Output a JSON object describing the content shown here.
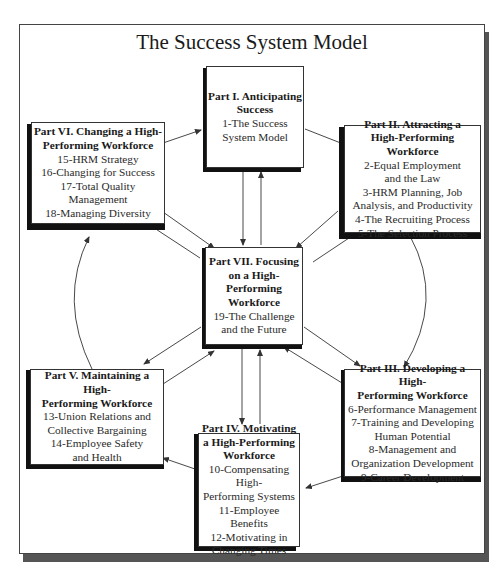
{
  "title": "The Success System Model",
  "nodes": {
    "p1": {
      "heading": [
        "Part I. Anticipating",
        "Success"
      ],
      "items": [
        "1-The Success",
        "System Model"
      ]
    },
    "p2": {
      "heading": [
        "Part II. Attracting a",
        "High-Performing Workforce"
      ],
      "items": [
        "2-Equal Employment",
        "and the Law",
        "3-HRM Planning, Job",
        "Analysis, and Productivity",
        "4-The Recruiting Process",
        "5-The Selection Process"
      ]
    },
    "p3": {
      "heading": [
        "Part III. Developing a High-",
        "Performing Workforce"
      ],
      "items": [
        "6-Performance Management",
        "7-Training and Developing",
        "Human Potential",
        "8-Management and",
        "Organization Development",
        "9-Career Development"
      ]
    },
    "p4": {
      "heading": [
        "Part IV. Motivating",
        "a High-Performing",
        "Workforce"
      ],
      "items": [
        "10-Compensating High-",
        "Performing Systems",
        "11-Employee Benefits",
        "12-Motivating in",
        "Changing Times"
      ]
    },
    "p5": {
      "heading": [
        "Part V. Maintaining a High-",
        "Performing Workforce"
      ],
      "items": [
        "13-Union Relations and",
        "Collective Bargaining",
        "14-Employee Safety",
        "and Health"
      ]
    },
    "p6": {
      "heading": [
        "Part VI. Changing a High-",
        "Performing Workforce"
      ],
      "items": [
        "15-HRM Strategy",
        "16-Changing for Success",
        "17-Total Quality Management",
        "18-Managing Diversity"
      ]
    },
    "p7": {
      "heading": [
        "Part VII. Focusing",
        "on a High-",
        "Performing",
        "Workforce"
      ],
      "items": [
        "19-The Challenge",
        "and the Future"
      ]
    }
  },
  "colors": {
    "box_border": "#333333",
    "box_shadow": "#111111",
    "frame_shadow": "#555555",
    "line": "#333333"
  }
}
